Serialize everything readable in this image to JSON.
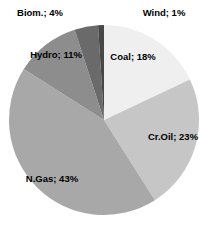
{
  "chart_data": {
    "type": "pie",
    "title": "",
    "categories": [
      "Coal",
      "Cr.Oil",
      "N.Gas",
      "Hydro",
      "Biom.",
      "Wind"
    ],
    "values": [
      18,
      23,
      43,
      11,
      4,
      1
    ],
    "unit": "%",
    "labels": [
      "Coal; 18%",
      "Cr.Oil; 23%",
      "N.Gas; 43%",
      "Hydro; 11%",
      "Biom.; 4%",
      "Wind; 1%"
    ],
    "colors": [
      "#efefef",
      "#c6c6c6",
      "#a8a8a8",
      "#8d8d8d",
      "#6a6a6a",
      "#474747"
    ],
    "start_angle_deg": 0,
    "direction": "clockwise",
    "legend": "none",
    "label_color": "#000000",
    "background": "#ffffff",
    "layout_hints": {
      "center_px": {
        "x": 104,
        "y": 120
      },
      "radius_px": 95,
      "label_positions_px": [
        {
          "x": 133,
          "y": 57
        },
        {
          "x": 173,
          "y": 137
        },
        {
          "x": 52,
          "y": 179
        },
        {
          "x": 56,
          "y": 55
        },
        {
          "x": 40,
          "y": 13
        },
        {
          "x": 164,
          "y": 13
        }
      ]
    }
  }
}
